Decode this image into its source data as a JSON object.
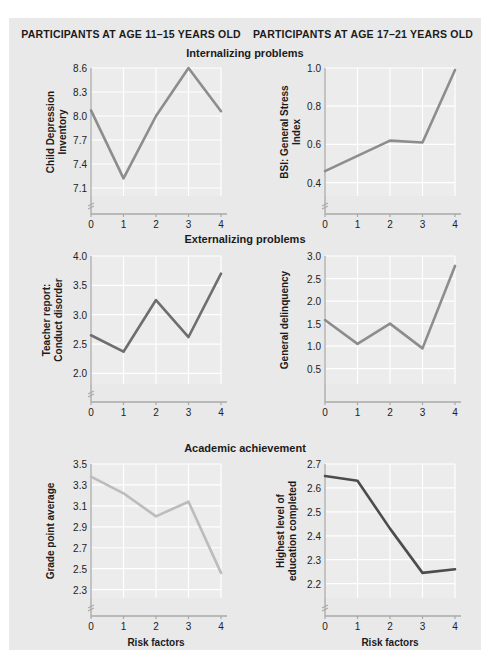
{
  "figure": {
    "column_headers": [
      "PARTICIPANTS AT AGE 11–15 YEARS OLD",
      "PARTICIPANTS AT AGE 17–21 YEARS OLD"
    ],
    "section_titles": [
      "Internalizing problems",
      "Externalizing problems",
      "Academic achievement"
    ],
    "background_color": "#e9e9e9",
    "plot_background_color": "#ececec",
    "gridline_color": "#ffffff",
    "axis_color": "#a8a8a8"
  },
  "chart_data": [
    {
      "id": "child-depression-inventory",
      "type": "line",
      "title": "Internalizing problems",
      "panel_group": "PARTICIPANTS AT AGE 11–15 YEARS OLD",
      "xlabel": "",
      "ylabel": "Child Depression Inventory",
      "categories": [
        0,
        1,
        2,
        3,
        4
      ],
      "x": [
        0,
        1,
        2,
        3,
        4
      ],
      "values": [
        8.07,
        7.22,
        8.0,
        8.6,
        8.06
      ],
      "xtick_labels": [
        "0",
        "1",
        "2",
        "3",
        "4"
      ],
      "ytick_labels": [
        "7.1",
        "7.4",
        "7.7",
        "8.0",
        "8.3",
        "8.6"
      ],
      "yticks": [
        7.1,
        7.4,
        7.7,
        8.0,
        8.3,
        8.6
      ],
      "ylim": [
        7.0,
        8.6
      ],
      "xlim": [
        0,
        4
      ],
      "axis_break": true,
      "grid": true,
      "line_color": "#8d8d8d",
      "legend": "none"
    },
    {
      "id": "bsi-general-stress-index",
      "type": "line",
      "title": "Internalizing problems",
      "panel_group": "PARTICIPANTS AT AGE 17–21 YEARS OLD",
      "xlabel": "",
      "ylabel": "BSI: General Stress Index",
      "categories": [
        0,
        1,
        2,
        3,
        4
      ],
      "x": [
        0,
        1,
        2,
        3,
        4
      ],
      "values": [
        0.46,
        0.54,
        0.62,
        0.61,
        0.99
      ],
      "xtick_labels": [
        "0",
        "1",
        "2",
        "3",
        "4"
      ],
      "ytick_labels": [
        "0.4",
        "0.6",
        "0.8",
        "1.0"
      ],
      "yticks": [
        0.4,
        0.6,
        0.8,
        1.0
      ],
      "ylim": [
        0.33,
        1.0
      ],
      "xlim": [
        0,
        4
      ],
      "axis_break": true,
      "grid": true,
      "line_color": "#8d8d8d",
      "legend": "none"
    },
    {
      "id": "teacher-report-conduct-disorder",
      "type": "line",
      "title": "Externalizing problems",
      "panel_group": "PARTICIPANTS AT AGE 11–15 YEARS OLD",
      "xlabel": "",
      "ylabel": "Teacher report:\nConduct disorder",
      "categories": [
        0,
        1,
        2,
        3,
        4
      ],
      "x": [
        0,
        1,
        2,
        3,
        4
      ],
      "values": [
        2.65,
        2.37,
        3.25,
        2.62,
        3.7
      ],
      "xtick_labels": [
        "0",
        "1",
        "2",
        "3",
        "4"
      ],
      "ytick_labels": [
        "2.0",
        "2.5",
        "3.0",
        "3.5",
        "4.0"
      ],
      "yticks": [
        2.0,
        2.5,
        3.0,
        3.5,
        4.0
      ],
      "ylim": [
        1.82,
        4.0
      ],
      "xlim": [
        0,
        4
      ],
      "axis_break": true,
      "grid": true,
      "line_color": "#6e6e6e",
      "legend": "none"
    },
    {
      "id": "general-delinquency",
      "type": "line",
      "title": "Externalizing problems",
      "panel_group": "PARTICIPANTS AT AGE 17–21 YEARS OLD",
      "xlabel": "",
      "ylabel": "General delinquency",
      "categories": [
        0,
        1,
        2,
        3,
        4
      ],
      "x": [
        0,
        1,
        2,
        3,
        4
      ],
      "values": [
        1.58,
        1.05,
        1.5,
        0.95,
        2.78
      ],
      "xtick_labels": [
        "0",
        "1",
        "2",
        "3",
        "4"
      ],
      "ytick_labels": [
        "0.5",
        "1.0",
        "1.5",
        "2.0",
        "2.5",
        "3.0"
      ],
      "yticks": [
        0.5,
        1.0,
        1.5,
        2.0,
        2.5,
        3.0
      ],
      "ylim": [
        0.16,
        3.0
      ],
      "xlim": [
        0,
        4
      ],
      "axis_break": false,
      "grid": true,
      "line_color": "#8d8d8d",
      "legend": "none"
    },
    {
      "id": "grade-point-average",
      "type": "line",
      "title": "Academic achievement",
      "panel_group": "PARTICIPANTS AT AGE 11–15 YEARS OLD",
      "xlabel": "Risk factors",
      "ylabel": "Grade point average",
      "categories": [
        0,
        1,
        2,
        3,
        4
      ],
      "x": [
        0,
        1,
        2,
        3,
        4
      ],
      "values": [
        3.38,
        3.22,
        3.0,
        3.14,
        2.46
      ],
      "xtick_labels": [
        "0",
        "1",
        "2",
        "3",
        "4"
      ],
      "ytick_labels": [
        "2.3",
        "2.5",
        "2.7",
        "2.9",
        "3.1",
        "3.3",
        "3.5"
      ],
      "yticks": [
        2.3,
        2.5,
        2.7,
        2.9,
        3.1,
        3.3,
        3.5
      ],
      "ylim": [
        2.22,
        3.5
      ],
      "xlim": [
        0,
        4
      ],
      "axis_break": true,
      "grid": true,
      "line_color": "#bcbcbc",
      "legend": "none"
    },
    {
      "id": "highest-level-of-education-completed",
      "type": "line",
      "title": "Academic achievement",
      "panel_group": "PARTICIPANTS AT AGE 17–21 YEARS OLD",
      "xlabel": "Risk factors",
      "ylabel": "Highest level of\neducation completed",
      "categories": [
        0,
        1,
        2,
        3,
        4
      ],
      "x": [
        0,
        1,
        2,
        3,
        4
      ],
      "values": [
        2.65,
        2.63,
        2.43,
        2.245,
        2.26
      ],
      "xtick_labels": [
        "0",
        "1",
        "2",
        "3",
        "4"
      ],
      "ytick_labels": [
        "2.2",
        "2.3",
        "2.4",
        "2.5",
        "2.6",
        "2.7"
      ],
      "yticks": [
        2.2,
        2.3,
        2.4,
        2.5,
        2.6,
        2.7
      ],
      "ylim": [
        2.14,
        2.7
      ],
      "xlim": [
        0,
        4
      ],
      "axis_break": true,
      "grid": true,
      "line_color": "#4c4c4c",
      "legend": "none"
    }
  ]
}
